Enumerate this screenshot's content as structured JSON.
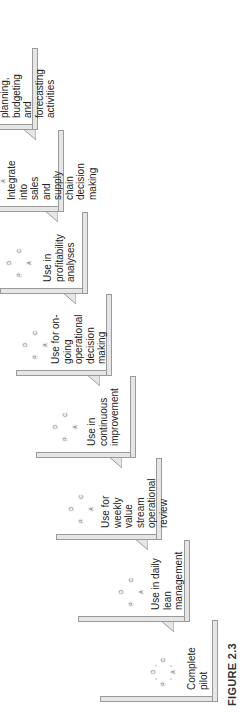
{
  "figure": {
    "label": "FIGURE 2.3",
    "type": "staircase",
    "cycle_letters": {
      "plan": "P",
      "do": "D",
      "check": "C",
      "act": "A"
    },
    "colors": {
      "step_fill": "#e6e6e6",
      "step_border": "#9a9a9a",
      "text": "#222222"
    }
  },
  "steps": [
    {
      "label": "Complete pilot"
    },
    {
      "label": "Use in daily lean\nmanagement"
    },
    {
      "label": "Use for weekly\nvalue stream\noperational\nreview"
    },
    {
      "label": "Use in\ncontinuous\nimprovement"
    },
    {
      "label": "Use for on-\ngoing\noperational\ndecision making"
    },
    {
      "label": "Use in\nprofitability\nanalyses"
    },
    {
      "label": "Integrate into\nsales and supply\nchain decision\nmaking"
    },
    {
      "label": "Integrate into all\nplanning,\nbudgeting and\nforecasting\nactivities"
    }
  ]
}
